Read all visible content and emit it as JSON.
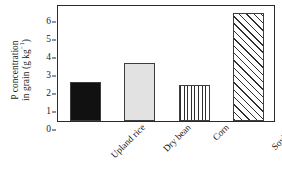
{
  "chart_data": {
    "type": "bar",
    "title": "",
    "subtitle": "",
    "xlabel": "",
    "ylabel_line1": "P concentration",
    "ylabel_line2": "in grain (g kg",
    "ylabel_superscript": "−1",
    "ylabel_line2_end": ")",
    "ylabel_full": "P concentration in grain (g kg−1)",
    "categories": [
      "Upland rice",
      "Dry bean",
      "Corn",
      "Soybean"
    ],
    "values": [
      2.15,
      3.2,
      2.0,
      6.0
    ],
    "series": [
      {
        "name": "P concentration in grain",
        "values": [
          2.15,
          3.2,
          2.0,
          6.0
        ]
      }
    ],
    "bar_fills": [
      "solid-black",
      "light-gray",
      "vertical-lines",
      "diagonal-hatch"
    ],
    "bar_fill_colors": [
      "#111111",
      "#e2e2e2",
      "#ffffff",
      "#ffffff"
    ],
    "bar_edge_color": "#3d3d3d",
    "ylim": [
      0,
      6.5
    ],
    "yticks": [
      0,
      1,
      2,
      3,
      4,
      5,
      6
    ],
    "ytick_labels": [
      "0",
      "1",
      "2",
      "3",
      "4",
      "5",
      "6"
    ],
    "grid": false,
    "legend": null,
    "legend_position": "none",
    "frame": "full-box",
    "tick_direction": "out",
    "annotations": [],
    "axis_color": "#2a2a2a",
    "background_color": "#ffffff"
  }
}
